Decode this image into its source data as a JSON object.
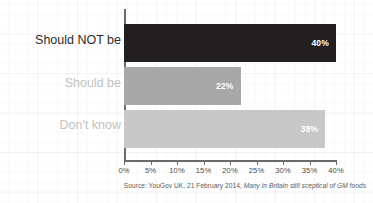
{
  "chart_data": {
    "type": "bar",
    "orientation": "horizontal",
    "title": "",
    "subtitle": "",
    "xlabel": "",
    "ylabel": "",
    "categories": [
      "Should NOT be",
      "Should be",
      "Don't know"
    ],
    "values": [
      40,
      22,
      38
    ],
    "value_labels": [
      "40%",
      "22%",
      "38%"
    ],
    "series": [
      {
        "name": "Share of respondents",
        "values": [
          40,
          22,
          38
        ]
      }
    ],
    "xlim": [
      0,
      40
    ],
    "xticks": [
      0,
      5,
      10,
      15,
      20,
      25,
      30,
      35,
      40
    ],
    "xtick_labels": [
      "0%",
      "5%",
      "10%",
      "15%",
      "20%",
      "25%",
      "30%",
      "35%",
      "40%"
    ],
    "grid": false,
    "background_grid": true,
    "legend": null,
    "legend_position": "none",
    "bar_colors": [
      "#231f20",
      "#a8a8a8",
      "#c8c8c8"
    ],
    "label_colors": [
      "#2b2b2b",
      "#c2c2c2",
      "#c2c2c2"
    ],
    "value_label_color": "#ffffff",
    "axis_color": "#6a6a6a",
    "annotations": []
  },
  "source_note": {
    "prefix": "Source: YouGov UK, 21 February 2014, ",
    "italic_part": "Many in Britain still sceptical of GM foods"
  }
}
